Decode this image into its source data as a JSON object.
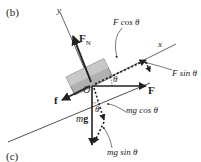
{
  "panel_labels": {
    "top": "(b)",
    "bottom": "(c)"
  },
  "axes": {
    "x": "x",
    "y": "y"
  },
  "origin": "O",
  "angle_symbol": "θ",
  "forces": {
    "normal": {
      "symbol": "F",
      "subscript": "N"
    },
    "friction": "f",
    "applied": "F",
    "weight": "mg"
  },
  "components": {
    "f_cos": "F cos θ",
    "f_sin": "F sin θ",
    "mg_cos": "mg cos θ",
    "mg_sin": "mg sin θ"
  },
  "colors": {
    "line": "#222222",
    "block_fill": "#a8a8a8",
    "block_light": "#d0d0d0"
  }
}
